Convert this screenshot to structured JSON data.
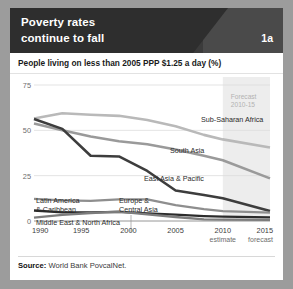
{
  "header": {
    "title_line1": "Poverty rates",
    "title_line2": "continue to fall",
    "badge": "1a",
    "dark_bg": "#2e2e2e",
    "light_bg": "#4a4a4a"
  },
  "source": {
    "label": "Source:",
    "text": "World Bank PovcalNet."
  },
  "chart_data": {
    "type": "line",
    "title": "Poverty rates continue to fall",
    "subtitle": "People living on less than 2005 PPP $1.25 a day (%)",
    "xlabel": "",
    "ylabel": "",
    "x": [
      1990,
      1995,
      2000,
      2005,
      2010,
      2015
    ],
    "xtick_labels": [
      "1990",
      "1995",
      "2000",
      "2005",
      "2010",
      "2015"
    ],
    "xtick_sublabels": [
      "",
      "",
      "",
      "",
      "estimate",
      "forecast"
    ],
    "ytick_labels": [
      "0",
      "25",
      "50",
      "75"
    ],
    "yticks": [
      0,
      25,
      50,
      75
    ],
    "ylim": [
      0,
      75
    ],
    "xlim": [
      1990,
      2015
    ],
    "grid": "horizontal",
    "legend": "inline-labels",
    "annotation": {
      "line1": "Forecast",
      "line2": "2010-15",
      "span_start": 2010,
      "span_end": 2015
    },
    "series": [
      {
        "name": "Sub-Saharan Africa",
        "color": "#b9b9b9",
        "width": 2.6,
        "x": [
          1990,
          1993,
          1996,
          1999,
          2002,
          2005,
          2008,
          2010,
          2015
        ],
        "values": [
          56.5,
          59.4,
          58.6,
          58.0,
          55.7,
          52.3,
          47.5,
          45.0,
          40.5
        ],
        "label_x": 2006,
        "label_y": 54.5
      },
      {
        "name": "South Asia",
        "color": "#9a9a9a",
        "width": 2.6,
        "x": [
          1990,
          1993,
          1996,
          1999,
          2002,
          2005,
          2008,
          2010,
          2015
        ],
        "values": [
          53.8,
          50.1,
          46.6,
          44.0,
          42.3,
          39.4,
          36.0,
          33.5,
          23.5
        ],
        "label_x": 2004,
        "label_y": 40.5
      },
      {
        "name": "East Asia & Pacific",
        "color": "#3d3d3d",
        "width": 2.6,
        "x": [
          1990,
          1993,
          1996,
          1999,
          2002,
          2005,
          2008,
          2010,
          2015
        ],
        "values": [
          56.2,
          50.8,
          36.0,
          35.6,
          27.6,
          16.8,
          14.3,
          12.5,
          5.5
        ],
        "label_x": 2003,
        "label_y": 28.0
      },
      {
        "name": "Latin America & Caribbean",
        "color": "#8e8e8e",
        "width": 2.3,
        "x": [
          1990,
          1993,
          1996,
          1999,
          2002,
          2005,
          2008,
          2010,
          2015
        ],
        "values": [
          12.2,
          11.4,
          11.1,
          11.9,
          11.9,
          8.7,
          6.5,
          5.5,
          4.6
        ],
        "label_x": 1992,
        "label_y": 22.0
      },
      {
        "name": "Middle East & North Africa",
        "color": "#2b2b2b",
        "width": 2.3,
        "x": [
          1990,
          1993,
          1996,
          1999,
          2002,
          2005,
          2008,
          2010,
          2015
        ],
        "values": [
          5.8,
          4.8,
          4.8,
          5.0,
          4.2,
          3.5,
          2.7,
          2.4,
          2.0
        ],
        "label_x": 1992,
        "label_y": 12.5
      },
      {
        "name": "Europe & Central Asia",
        "color": "#7c7c7c",
        "width": 2.3,
        "x": [
          1990,
          1993,
          1996,
          1999,
          2002,
          2005,
          2008,
          2010,
          2015
        ],
        "values": [
          1.9,
          3.4,
          4.4,
          5.2,
          3.6,
          2.2,
          0.9,
          0.8,
          0.6
        ],
        "label_x": 2000,
        "label_y": 22.0
      }
    ],
    "inline_labels": [
      {
        "text": "Sub-Saharan Africa",
        "x": 183,
        "y": 47,
        "anchor": "start"
      },
      {
        "text": "South Asia",
        "x": 152,
        "y": 78,
        "anchor": "start"
      },
      {
        "text": "East Asia & Pacific",
        "x": 126,
        "y": 106,
        "anchor": "start"
      },
      {
        "text": "Latin America",
        "x": 18,
        "y": 128,
        "anchor": "start"
      },
      {
        "text": "& Caribbean",
        "x": 18,
        "y": 137,
        "anchor": "start"
      },
      {
        "text": "Europe &",
        "x": 101,
        "y": 128,
        "anchor": "start"
      },
      {
        "text": "Central Asia",
        "x": 101,
        "y": 137,
        "anchor": "start"
      },
      {
        "text": "Middle East & North Africa",
        "x": 18,
        "y": 150,
        "anchor": "start"
      }
    ]
  }
}
